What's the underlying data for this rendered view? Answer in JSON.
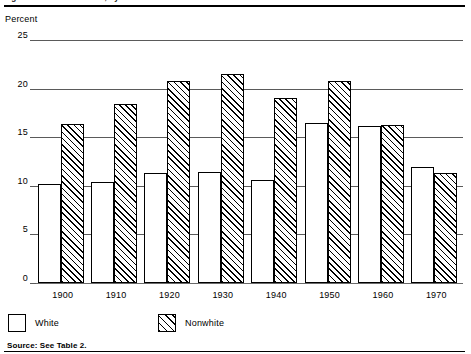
{
  "figure": {
    "title": "Figure 3. Percent Illiterate, by Race: 1900 to 1970",
    "axis_caption": "Percent",
    "source_note": "Source: See Table 2."
  },
  "legend": {
    "position": "bottom-left",
    "items": [
      {
        "label": "White",
        "swatch": "open-square-swatch"
      },
      {
        "label": "Nonwhite",
        "swatch": "hatched-square-swatch"
      }
    ]
  },
  "chart_data": {
    "type": "bar",
    "title": "Figure 3. Percent Illiterate, by Race: 1900 to 1970",
    "xlabel": "",
    "ylabel": "Percent",
    "ylim": [
      0,
      25
    ],
    "yticks": [
      0,
      5,
      10,
      15,
      20,
      25
    ],
    "ytick_labels": [
      "0",
      "5",
      "10",
      "15",
      "20",
      "25"
    ],
    "grid": true,
    "legend_position": "below-axes-left",
    "categories": [
      "1900",
      "1910",
      "1920",
      "1930",
      "1940",
      "1950",
      "1960",
      "1970"
    ],
    "series": [
      {
        "name": "White",
        "values": [
          10.2,
          10.4,
          11.3,
          11.4,
          10.6,
          16.5,
          16.2,
          11.9
        ]
      },
      {
        "name": "Nonwhite",
        "values": [
          16.4,
          18.4,
          20.8,
          21.5,
          19.0,
          20.8,
          16.3,
          11.3
        ]
      }
    ]
  }
}
